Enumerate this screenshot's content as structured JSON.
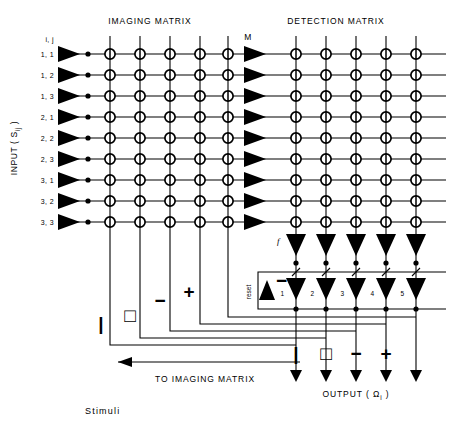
{
  "figure": {
    "titles": {
      "imaging_matrix": "IMAGING  MATRIX",
      "detection_matrix": "DETECTION  MATRIX"
    },
    "axis_label_left": "INPUT ( S",
    "axis_label_left_sub": "ij",
    "axis_label_left_tail": " )",
    "amplifier_column_label": "M",
    "feedback_label": "f",
    "reset_label": "reset",
    "reset_sign": "−",
    "bottom_left_label": "TO IMAGING MATRIX",
    "output_label": "OUTPUT ( Ω",
    "output_label_sub": "i",
    "output_label_tail": " )",
    "caption": "Stimuli",
    "row_header": "i, j",
    "row_labels": [
      "1, 1",
      "1, 2",
      "1, 3",
      "2, 1",
      "2, 2",
      "2, 3",
      "3, 1",
      "3, 2",
      "3, 3"
    ],
    "detector_numbers": [
      "1",
      "2",
      "3",
      "4",
      "5"
    ],
    "feedback_symbols": [
      "|",
      "□",
      "−",
      "+"
    ],
    "output_symbols": [
      "|",
      "□",
      "−",
      "+"
    ],
    "counts": {
      "rows": 9,
      "imaging_columns": 5,
      "detection_columns": 5,
      "input_amplifiers": 9,
      "mid_amplifiers": 9,
      "output_arrows": 5
    },
    "colors": {
      "ink": "#000000",
      "background": "#ffffff"
    }
  }
}
